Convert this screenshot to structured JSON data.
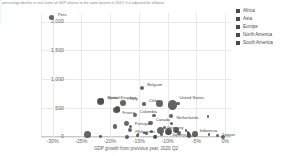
{
  "caption": "percentage decline in real terms of GDP relative to the same quarter in 2019. It is adjusted for inflation.",
  "chart_data": {
    "type": "scatter",
    "title": "",
    "xlabel": "GDP growth from previous year, 2020 Q2",
    "ylabel": "Confirmed deaths per million people (Aug 30)",
    "xlim": [
      -32,
      1
    ],
    "ylim": [
      0,
      2150
    ],
    "xticks": [
      "-30%",
      "-25%",
      "-20%",
      "-15%",
      "-10%",
      "-5%",
      "0%"
    ],
    "xtickvals": [
      -30,
      -25,
      -20,
      -15,
      -10,
      -5,
      0
    ],
    "yticks": [
      "2,000",
      "1,500",
      "1,000",
      "500",
      "0"
    ],
    "ytickvals": [
      2000,
      1500,
      1000,
      500,
      0
    ],
    "grid": true,
    "legend_position": "right",
    "legend": [
      {
        "label": "Africa",
        "color": "#4a4a4a"
      },
      {
        "label": "Asia",
        "color": "#4a4a4a"
      },
      {
        "label": "Europe",
        "color": "#4a4a4a"
      },
      {
        "label": "North America",
        "color": "#4a4a4a"
      },
      {
        "label": "South America",
        "color": "#4a4a4a"
      }
    ],
    "points": [
      {
        "name": "Peru",
        "x": -30.2,
        "y": 2065,
        "r": 2.6,
        "label": true,
        "lx": 4,
        "ly": -3
      },
      {
        "name": "Belgium",
        "x": -14.4,
        "y": 855,
        "r": 2.0,
        "label": true,
        "lx": 3,
        "ly": -3
      },
      {
        "name": "United Kingdom",
        "x": -21.7,
        "y": 615,
        "r": 3.3,
        "label": true,
        "lx": 4,
        "ly": -4
      },
      {
        "name": "Italy",
        "x": -17.7,
        "y": 588,
        "r": 3.0,
        "label": true,
        "lx": 4,
        "ly": -4
      },
      {
        "name": "France",
        "x": -18.9,
        "y": 465,
        "r": 3.1,
        "label": true,
        "lx": 3,
        "ly": 3
      },
      {
        "name": "United States",
        "x": -9.1,
        "y": 555,
        "r": 4.6,
        "label": true,
        "lx": 2,
        "ly": -7
      },
      {
        "name": "Chile",
        "x": -14.1,
        "y": 575,
        "r": 1.7,
        "label": true,
        "lx": 3,
        "ly": -3
      },
      {
        "name": "Spain",
        "x": -21.5,
        "y": 625,
        "r": 3.0,
        "label": true,
        "lx": 3,
        "ly": -3
      },
      {
        "name": "Colombia",
        "x": -15.7,
        "y": 375,
        "r": 2.0,
        "label": true,
        "lx": 3,
        "ly": -3
      },
      {
        "name": "Portugal",
        "x": -16.5,
        "y": 175,
        "r": 1.6,
        "label": true,
        "lx": 3,
        "ly": -3
      },
      {
        "name": "Philippines",
        "x": -16.5,
        "y": 120,
        "r": 2.0,
        "label": true,
        "lx": 3,
        "ly": 2
      },
      {
        "name": "Canada",
        "x": -13.0,
        "y": 240,
        "r": 2.3,
        "label": true,
        "lx": 3,
        "ly": -3
      },
      {
        "name": "Netherlands",
        "x": -9.4,
        "y": 365,
        "r": 2.3,
        "label": true,
        "lx": 3,
        "ly": 2
      },
      {
        "name": "Germany",
        "x": -11.3,
        "y": 110,
        "r": 3.5,
        "label": true,
        "lx": 3,
        "ly": -3
      },
      {
        "name": "Japan",
        "x": -9.9,
        "y": 95,
        "r": 3.4,
        "label": true,
        "lx": 0,
        "ly": 3
      },
      {
        "name": "Poland",
        "x": -8.0,
        "y": 75,
        "r": 2.1,
        "label": true,
        "lx": 2,
        "ly": 3
      },
      {
        "name": "Indonesia",
        "x": -5.3,
        "y": 55,
        "r": 2.9,
        "label": true,
        "lx": 2,
        "ly": -3
      },
      {
        "name": "Taiwan",
        "x": -1.3,
        "y": 30,
        "r": 1.6,
        "label": true,
        "lx": 3,
        "ly": 0
      },
      {
        "name": "Korea",
        "x": -2.8,
        "y": 40,
        "r": 1.2,
        "label": false,
        "lx": 3,
        "ly": 0
      },
      {
        "name": "Mexico",
        "x": -18.7,
        "y": 490,
        "r": 2.8,
        "label": false,
        "lx": 3,
        "ly": 0
      },
      {
        "name": "Austria",
        "x": -12.8,
        "y": 90,
        "r": 1.5,
        "label": false,
        "lx": 3,
        "ly": 0
      },
      {
        "name": "Sweden",
        "x": -8.2,
        "y": 575,
        "r": 1.6,
        "label": false,
        "lx": 3,
        "ly": 0
      },
      {
        "name": "Brazil",
        "x": -11.4,
        "y": 580,
        "r": 3.3,
        "label": false,
        "lx": 3,
        "ly": 0
      },
      {
        "name": "Argentina",
        "x": -19.1,
        "y": 185,
        "r": 2.2,
        "label": false,
        "lx": 3,
        "ly": 0
      },
      {
        "name": "Turkey",
        "x": -9.9,
        "y": 75,
        "r": 2.6,
        "label": false,
        "lx": 3,
        "ly": 0
      },
      {
        "name": "Greece",
        "x": -15.2,
        "y": 25,
        "r": 1.3,
        "label": false,
        "lx": 3,
        "ly": 0
      },
      {
        "name": "Czechia",
        "x": -11.0,
        "y": 40,
        "r": 1.5,
        "label": false,
        "lx": 3,
        "ly": 0
      },
      {
        "name": "Hungary",
        "x": -13.6,
        "y": 65,
        "r": 1.5,
        "label": false,
        "lx": 3,
        "ly": 0
      },
      {
        "name": "Belgium2",
        "x": -14.0,
        "y": 70,
        "r": 1.3,
        "label": false,
        "lx": 3,
        "ly": 0
      },
      {
        "name": "Romania",
        "x": -10.5,
        "y": 170,
        "r": 1.6,
        "label": false,
        "lx": 3,
        "ly": 0
      },
      {
        "name": "South Africa",
        "x": -17.1,
        "y": 235,
        "r": 2.4,
        "label": false,
        "lx": 3,
        "ly": 0
      },
      {
        "name": "India",
        "x": -23.9,
        "y": 45,
        "r": 3.6,
        "label": false,
        "lx": 3,
        "ly": 0
      },
      {
        "name": "Malaysia",
        "x": -17.1,
        "y": 4,
        "r": 1.9,
        "label": false,
        "lx": 3,
        "ly": 0
      },
      {
        "name": "Thailand",
        "x": -12.2,
        "y": 1,
        "r": 2.1,
        "label": false,
        "lx": 3,
        "ly": 0
      },
      {
        "name": "Norway",
        "x": -6.3,
        "y": 50,
        "r": 1.3,
        "label": false,
        "lx": 3,
        "ly": 0
      },
      {
        "name": "Finland",
        "x": -6.4,
        "y": 60,
        "r": 1.2,
        "label": false,
        "lx": 3,
        "ly": 0
      },
      {
        "name": "Denmark",
        "x": -8.5,
        "y": 110,
        "r": 1.3,
        "label": false,
        "lx": 3,
        "ly": 0
      },
      {
        "name": "Switzerland",
        "x": -9.3,
        "y": 230,
        "r": 1.6,
        "label": false,
        "lx": 3,
        "ly": 0
      },
      {
        "name": "Ireland",
        "x": -3.0,
        "y": 360,
        "r": 1.4,
        "label": false,
        "lx": 3,
        "ly": 0
      },
      {
        "name": "Israel",
        "x": -6.8,
        "y": 110,
        "r": 1.4,
        "label": false,
        "lx": 3,
        "ly": 0
      },
      {
        "name": "Vietnam",
        "x": -0.4,
        "y": 3,
        "r": 1.9,
        "label": false,
        "lx": 3,
        "ly": 0
      },
      {
        "name": "Russia",
        "x": -8.5,
        "y": 120,
        "r": 3.0,
        "label": false,
        "lx": 3,
        "ly": 0
      },
      {
        "name": "Slovakia",
        "x": -12.1,
        "y": 6,
        "r": 1.2,
        "label": false,
        "lx": 3,
        "ly": 0
      },
      {
        "name": "Bulgaria",
        "x": -8.5,
        "y": 90,
        "r": 1.2,
        "label": false,
        "lx": 3,
        "ly": 0
      },
      {
        "name": "Croatia",
        "x": -15.1,
        "y": 45,
        "r": 1.1,
        "label": false,
        "lx": 3,
        "ly": 0
      },
      {
        "name": "Estonia",
        "x": -6.5,
        "y": 50,
        "r": 1.0,
        "label": false,
        "lx": 3,
        "ly": 0
      },
      {
        "name": "Tunisia",
        "x": -21.6,
        "y": 5,
        "r": 1.4,
        "label": false,
        "lx": 3,
        "ly": 0
      },
      {
        "name": "Ecuador",
        "x": -12.4,
        "y": 370,
        "r": 1.8,
        "label": false,
        "lx": 3,
        "ly": 0
      },
      {
        "name": "Serbia",
        "x": -6.5,
        "y": 80,
        "r": 1.3,
        "label": false,
        "lx": 3,
        "ly": 0
      },
      {
        "name": "Australia",
        "x": -6.3,
        "y": 25,
        "r": 2.3,
        "label": false,
        "lx": 3,
        "ly": 0
      }
    ]
  }
}
